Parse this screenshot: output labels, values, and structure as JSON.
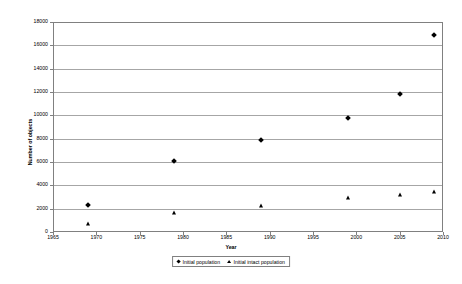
{
  "chart_data": {
    "type": "scatter",
    "title": "",
    "xlabel": "Year",
    "ylabel": "Number of objects",
    "xlim": [
      1965,
      2010
    ],
    "ylim": [
      0,
      18000
    ],
    "xticks": [
      1965,
      1970,
      1975,
      1980,
      1985,
      1990,
      1995,
      2000,
      2005,
      2010
    ],
    "yticks": [
      0,
      2000,
      4000,
      6000,
      8000,
      10000,
      12000,
      14000,
      16000,
      18000
    ],
    "grid": "horizontal",
    "legend_position": "bottom-center",
    "series": [
      {
        "name": "Initial population",
        "marker": "diamond",
        "color": "#000000",
        "points": [
          {
            "x": 1969,
            "y": 2300
          },
          {
            "x": 1979,
            "y": 6100
          },
          {
            "x": 1989,
            "y": 7900
          },
          {
            "x": 1999,
            "y": 9800
          },
          {
            "x": 2005,
            "y": 11800
          },
          {
            "x": 2009,
            "y": 16900
          }
        ]
      },
      {
        "name": "Initial intact population",
        "marker": "triangle",
        "color": "#000000",
        "points": [
          {
            "x": 1969,
            "y": 700
          },
          {
            "x": 1979,
            "y": 1600
          },
          {
            "x": 1989,
            "y": 2200
          },
          {
            "x": 1999,
            "y": 2900
          },
          {
            "x": 2005,
            "y": 3200
          },
          {
            "x": 2009,
            "y": 3400
          }
        ]
      }
    ]
  }
}
